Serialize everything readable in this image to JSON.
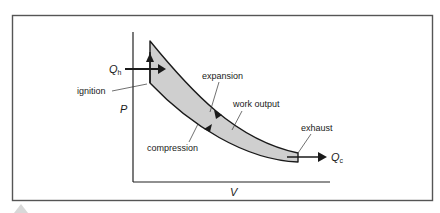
{
  "diagram": {
    "axes": {
      "y_label": "P",
      "x_label": "V"
    },
    "heat_in": {
      "symbol": "Q",
      "subscript": "h"
    },
    "heat_out": {
      "symbol": "Q",
      "subscript": "c"
    },
    "labels": {
      "ignition": "ignition",
      "expansion": "expansion",
      "work_output": "work output",
      "compression": "compression",
      "exhaust": "exhaust"
    },
    "colors": {
      "line": "#1a1a1a",
      "fill": "#cfcfcf",
      "frame": "#555555",
      "background": "#ffffff"
    }
  }
}
